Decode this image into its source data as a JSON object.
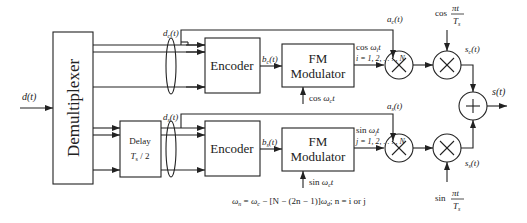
{
  "diagram": {
    "input": {
      "label": "d(t)"
    },
    "blocks": {
      "demux": {
        "label": "Demultiplexer"
      },
      "delay": {
        "line1": "Delay",
        "line2": "T",
        "line2_sub": "s",
        "line2_rest": " / 2"
      },
      "encoder_top": {
        "label": "Encoder"
      },
      "encoder_bottom": {
        "label": "Encoder"
      },
      "fm_top": {
        "line1": "FM",
        "line2": "Modulator"
      },
      "fm_bottom": {
        "line1": "FM",
        "line2": "Modulator"
      }
    },
    "signals": {
      "dc": {
        "main": "d",
        "sub": "c",
        "rest": "(t)"
      },
      "ds": {
        "main": "d",
        "sub": "s",
        "rest": "(t)"
      },
      "bc": {
        "main": "b",
        "sub": "c",
        "rest": "(t)"
      },
      "bs": {
        "main": "b",
        "sub": "s",
        "rest": "(t)"
      },
      "ac": {
        "main": "a",
        "sub": "c",
        "rest": "(t)"
      },
      "as": {
        "main": "a",
        "sub": "s",
        "rest": "(t)"
      },
      "sc": {
        "main": "s",
        "sub": "c",
        "rest": "(t)"
      },
      "ss": {
        "main": "s",
        "sub": "s",
        "rest": "(t)"
      },
      "output": {
        "label": "s(t)"
      }
    },
    "carriers": {
      "top_in": {
        "pre": "cos ",
        "omega": "ω",
        "sub": "c",
        "post": "t"
      },
      "bottom_in": {
        "pre": "sin ",
        "omega": "ω",
        "sub": "c",
        "post": "t"
      },
      "top_out": {
        "pre": "cos ",
        "omega": "ω",
        "sub": "i",
        "post": "t"
      },
      "bottom_out": {
        "pre": "sin ",
        "omega": "ω",
        "sub": "j",
        "post": "t"
      },
      "top_index": "i = 1, 2, . . . , N",
      "bottom_index": "j = 1, 2, . . . , N"
    },
    "pulse_shapes": {
      "top": {
        "fn": "cos",
        "num": "πt",
        "den": "T",
        "den_sub": "s"
      },
      "bottom": {
        "fn": "sin",
        "num": "πt",
        "den": "T",
        "den_sub": "s"
      }
    },
    "equation": "ωn = ωc − [N − (2n − 1)]ωd;   n = i or j",
    "equation_parts": {
      "w": "ω",
      "n": "n",
      "eq": " = ",
      "c": "c",
      "mid": " − [N − (2n − 1)]",
      "d": "d",
      "tail": ";   n = i or j"
    },
    "operators": {
      "multiply": "×",
      "sum": "+"
    }
  }
}
